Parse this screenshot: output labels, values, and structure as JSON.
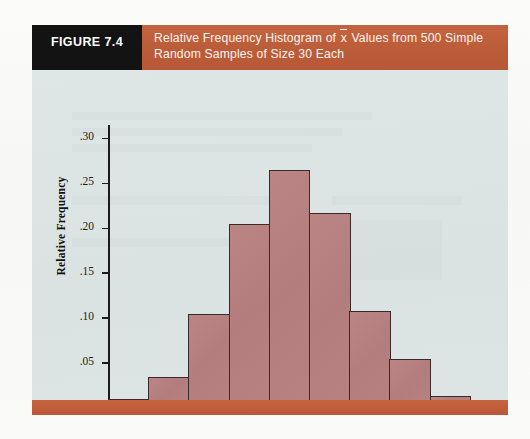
{
  "figure": {
    "tag": "FIGURE 7.4",
    "title_line1_a": "Relative Frequency Histogram of ",
    "title_line1_xbar": "x",
    "title_line1_b": " Values from 500 Simple",
    "title_line2": "Random Samples of Size 30 Each"
  },
  "colors": {
    "band": "#c15f3c",
    "tag_bg": "#131313",
    "panel_bg": "#dde6e4",
    "bar_fill": "#b88181",
    "bar_stroke": "#3a2b2b",
    "axis": "#1c1c1c"
  },
  "chart_data": {
    "type": "bar",
    "xlabel": "Values of x̄",
    "ylabel": "Relative Frequency",
    "grid": false,
    "legend": null,
    "xlim": [
      69500,
      74250
    ],
    "ylim": [
      0,
      0.315
    ],
    "x_tick_labels": [
      "70,000",
      "71,000",
      "72,000",
      "73,000",
      "74,000"
    ],
    "x_tick_values": [
      70000,
      71000,
      72000,
      73000,
      74000
    ],
    "y_tick_labels": [
      ".05",
      ".10",
      ".15",
      ".20",
      ".25",
      ".30"
    ],
    "y_tick_values": [
      0.05,
      0.1,
      0.15,
      0.2,
      0.25,
      0.3
    ],
    "bin_width": 500,
    "bin_edges": [
      69500,
      70000,
      70500,
      71000,
      71500,
      72000,
      72500,
      73000,
      73500,
      74000
    ],
    "categories": [
      "69,500-70,000",
      "70,000-70,500",
      "70,500-71,000",
      "71,000-71,500",
      "71,500-72,000",
      "72,000-72,500",
      "72,500-73,000",
      "73,000-73,500",
      "73,500-74,000"
    ],
    "values": [
      0.01,
      0.035,
      0.105,
      0.205,
      0.265,
      0.217,
      0.108,
      0.055,
      0.013
    ]
  }
}
